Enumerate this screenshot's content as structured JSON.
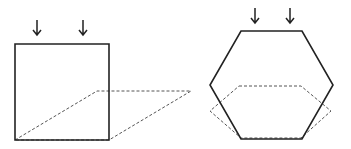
{
  "diagram": {
    "colors": {
      "stroke": "#222222",
      "dashed": "#555555",
      "background": "#ffffff"
    },
    "figures": [
      {
        "name": "square",
        "outline": [
          [
            15,
            44
          ],
          [
            109,
            44
          ],
          [
            109,
            140
          ],
          [
            15,
            140
          ]
        ],
        "dashed_projection": [
          [
            15,
            140
          ],
          [
            97,
            91
          ],
          [
            191,
            91
          ],
          [
            109,
            140
          ]
        ],
        "arrows_x": [
          37,
          83
        ],
        "arrow_y": [
          20,
          35
        ]
      },
      {
        "name": "hexagon",
        "outline": [
          [
            241,
            31
          ],
          [
            302,
            31
          ],
          [
            333,
            85
          ],
          [
            302,
            139
          ],
          [
            241,
            139
          ],
          [
            210,
            85
          ]
        ],
        "dashed_projection": [
          [
            239,
            86
          ],
          [
            301,
            86
          ],
          [
            331,
            111
          ],
          [
            301,
            138
          ],
          [
            241,
            138
          ],
          [
            210,
            111
          ]
        ],
        "arrows_x": [
          255,
          290
        ],
        "arrow_y": [
          8,
          23
        ]
      }
    ]
  }
}
